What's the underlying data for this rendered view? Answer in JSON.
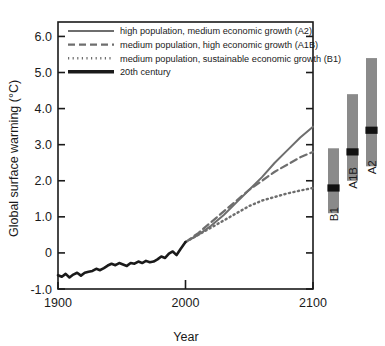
{
  "chart_data": {
    "type": "line",
    "title": "",
    "xlabel": "Year",
    "ylabel": "Global surface warming (°C)",
    "xlim": [
      1900,
      2100
    ],
    "ylim": [
      -1.0,
      6.4
    ],
    "xticks": [
      1900,
      2000,
      2100
    ],
    "xtick_labels": [
      "1900",
      "2000",
      "2100"
    ],
    "yticks": [
      -1.0,
      0,
      1.0,
      2.0,
      3.0,
      4.0,
      5.0,
      6.0
    ],
    "ytick_labels": [
      "-1.0",
      "0",
      "1.0",
      "2.0",
      "3.0",
      "4.0",
      "5.0",
      "6.0"
    ],
    "grid": false,
    "legend_position": "top-left",
    "series": [
      {
        "name": "high population, medium economic growth (A2)",
        "code": "A2",
        "style": "solid",
        "color": "#6e6e6e",
        "x": [
          2000,
          2010,
          2020,
          2030,
          2040,
          2050,
          2060,
          2070,
          2080,
          2090,
          2100
        ],
        "values": [
          0.3,
          0.5,
          0.75,
          1.05,
          1.4,
          1.75,
          2.1,
          2.5,
          2.85,
          3.2,
          3.5
        ]
      },
      {
        "name": "medium population, high economic growth (A1B)",
        "code": "A1B",
        "style": "dashed",
        "color": "#6e6e6e",
        "x": [
          2000,
          2010,
          2020,
          2030,
          2040,
          2050,
          2060,
          2070,
          2080,
          2090,
          2100
        ],
        "values": [
          0.3,
          0.55,
          0.85,
          1.15,
          1.45,
          1.75,
          2.0,
          2.25,
          2.45,
          2.65,
          2.8
        ]
      },
      {
        "name": "medium population, sustainable economic growth (B1)",
        "code": "B1",
        "style": "dotted",
        "color": "#6e6e6e",
        "x": [
          2000,
          2010,
          2020,
          2030,
          2040,
          2050,
          2060,
          2070,
          2080,
          2090,
          2100
        ],
        "values": [
          0.3,
          0.5,
          0.7,
          0.9,
          1.1,
          1.3,
          1.45,
          1.55,
          1.65,
          1.73,
          1.8
        ]
      },
      {
        "name": "20th century",
        "code": "20C",
        "style": "thick-solid",
        "color": "#1a1a1a",
        "x": [
          1900,
          1903,
          1906,
          1909,
          1912,
          1915,
          1918,
          1921,
          1924,
          1927,
          1930,
          1933,
          1936,
          1939,
          1942,
          1945,
          1948,
          1951,
          1954,
          1957,
          1960,
          1963,
          1966,
          1969,
          1972,
          1975,
          1978,
          1981,
          1984,
          1987,
          1990,
          1993,
          1996,
          2000
        ],
        "values": [
          -0.62,
          -0.66,
          -0.58,
          -0.68,
          -0.6,
          -0.55,
          -0.63,
          -0.55,
          -0.52,
          -0.5,
          -0.44,
          -0.48,
          -0.42,
          -0.35,
          -0.3,
          -0.34,
          -0.28,
          -0.32,
          -0.36,
          -0.28,
          -0.3,
          -0.24,
          -0.28,
          -0.22,
          -0.26,
          -0.24,
          -0.18,
          -0.1,
          -0.14,
          -0.02,
          0.04,
          -0.06,
          0.1,
          0.3
        ]
      }
    ],
    "ranges": {
      "note": "Likely range bars for year-2100 warming with best-estimate marker",
      "bars": [
        {
          "label": "B1",
          "low": 1.1,
          "high": 2.9,
          "best": 1.8,
          "color": "#8a8a8a",
          "marker_color": "#111111"
        },
        {
          "label": "A1B",
          "low": 2.0,
          "high": 4.4,
          "best": 2.8,
          "color": "#8a8a8a",
          "marker_color": "#111111"
        },
        {
          "label": "A2",
          "low": 2.4,
          "high": 5.4,
          "best": 3.4,
          "color": "#8a8a8a",
          "marker_color": "#111111"
        }
      ]
    }
  },
  "legend": {
    "items": [
      {
        "label": "high population, medium economic growth (A2)",
        "style": "solid"
      },
      {
        "label": "medium population, high economic growth (A1B)",
        "style": "dashed"
      },
      {
        "label": "medium population, sustainable economic growth (B1)",
        "style": "dotted"
      },
      {
        "label": "20th century",
        "style": "thick-solid"
      }
    ]
  },
  "axes": {
    "y_title": "Global surface warming (°C)",
    "x_title": "Year"
  }
}
